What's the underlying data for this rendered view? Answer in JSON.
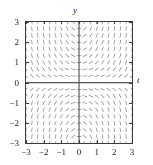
{
  "figure": {
    "axis_names": {
      "y": "y",
      "t": "t"
    },
    "colors": {
      "frame": "#3b3b3b",
      "axis": "#4a4a4a",
      "segment": "#9a9a9a",
      "tick": "#3b3b3b",
      "background": "#ffffff",
      "text": "#1a1a1a"
    }
  },
  "chart_data": {
    "type": "scatter",
    "subtype": "direction-field",
    "title": "",
    "xlabel": "t",
    "ylabel": "y",
    "xlim": [
      -3,
      3
    ],
    "ylim": [
      -3,
      3
    ],
    "grid": false,
    "legend": null,
    "x_ticks": [
      -3,
      -2,
      -1,
      0,
      1,
      2,
      3
    ],
    "y_ticks": [
      -3,
      -2,
      -1,
      0,
      1,
      2,
      3
    ],
    "x_tick_labels": [
      "−3",
      "−2",
      "−1",
      "0",
      "1",
      "2",
      "3"
    ],
    "y_tick_labels": [
      "3",
      "2",
      "1",
      "0",
      "−1",
      "−2",
      "−3"
    ],
    "slope_formula": "t*y",
    "grid_nx": 19,
    "grid_ny": 19,
    "segment_len_px": 4.6
  }
}
